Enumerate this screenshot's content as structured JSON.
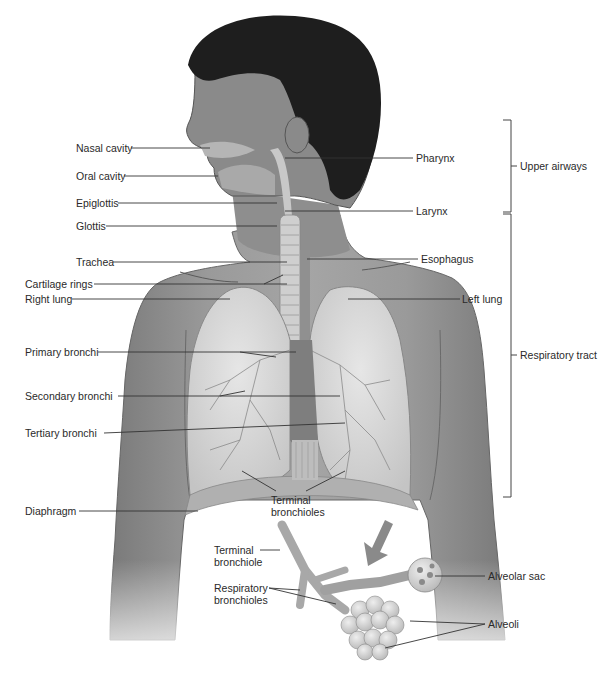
{
  "figure": {
    "colors": {
      "background": "#ffffff",
      "skin": "#8c8c8c",
      "skin_dark": "#6e6e6e",
      "hair": "#1e1e1e",
      "lung": "#d9d9d9",
      "airway": "#c8c8c8",
      "leader_line": "#333333",
      "text": "#2a2a2a"
    }
  },
  "labels_left": [
    {
      "id": "nasal-cavity",
      "text": "Nasal cavity"
    },
    {
      "id": "oral-cavity",
      "text": "Oral cavity"
    },
    {
      "id": "epiglottis",
      "text": "Epiglottis"
    },
    {
      "id": "glottis",
      "text": "Glottis"
    },
    {
      "id": "trachea",
      "text": "Trachea"
    },
    {
      "id": "cartilage-rings",
      "text": "Cartilage rings"
    },
    {
      "id": "right-lung",
      "text": "Right lung"
    },
    {
      "id": "primary-bronchi",
      "text": "Primary bronchi"
    },
    {
      "id": "secondary-bronchi",
      "text": "Secondary bronchi"
    },
    {
      "id": "tertiary-bronchi",
      "text": "Tertiary bronchi"
    },
    {
      "id": "diaphragm",
      "text": "Diaphragm"
    }
  ],
  "labels_right": [
    {
      "id": "pharynx",
      "text": "Pharynx"
    },
    {
      "id": "larynx",
      "text": "Larynx"
    },
    {
      "id": "esophagus",
      "text": "Esophagus"
    },
    {
      "id": "left-lung",
      "text": "Left lung"
    }
  ],
  "labels_center": {
    "terminal_bronchioles": "Terminal bronchioles",
    "terminal_bronchiole": "Terminal bronchiole",
    "respiratory_bronchioles": "Respiratory bronchioles",
    "alveolar_sac": "Alveolar sac",
    "alveoli": "Alveoli"
  },
  "brackets": [
    {
      "id": "upper-airways",
      "text": "Upper airways"
    },
    {
      "id": "respiratory-tract",
      "text": "Respiratory tract"
    }
  ]
}
